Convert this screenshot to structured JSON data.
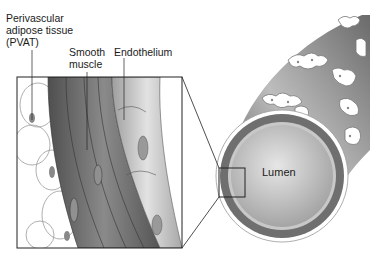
{
  "labels": {
    "pvat": [
      "Perivascular",
      "adipose tissue",
      "(PVAT)"
    ],
    "smooth_muscle": [
      "Smooth",
      "muscle"
    ],
    "endothelium": "Endothelium",
    "lumen": "Lumen"
  },
  "colors": {
    "background": "#ffffff",
    "muscle_dark": "#5e5e5e",
    "muscle_mid": "#7a7a7a",
    "endothelium": "#b8b8b8",
    "adipose_outline": "#9a9a9a",
    "lumen_fill": "#cfcfcf",
    "vessel_wall": "#6f6f6f",
    "line": "#222222"
  }
}
